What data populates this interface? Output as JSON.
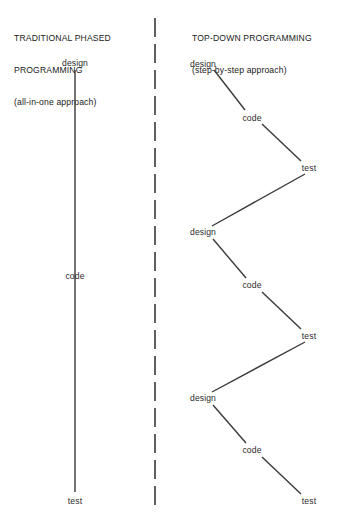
{
  "diagram": {
    "title_left_lines": [
      "TRADITIONAL PHASED",
      "PROGRAMMING"
    ],
    "title_left_sub": "(all-in-one approach)",
    "title_right_lines": [
      "TOP-DOWN PROGRAMMING"
    ],
    "title_right_sub": "(step-by-step approach)",
    "stroke_color": "#3a3a3a",
    "text_color": "#1a1a1a",
    "background_color": "#ffffff",
    "left_column": {
      "nodes": [
        {
          "label": "design",
          "x": 75,
          "y": 63
        },
        {
          "label": "code",
          "x": 75,
          "y": 276
        },
        {
          "label": "test",
          "x": 75,
          "y": 501
        }
      ],
      "line": {
        "x": 75,
        "y1": 70,
        "y2": 492
      }
    },
    "right_column": {
      "nodes": [
        {
          "label": "design",
          "x": 203,
          "y": 64
        },
        {
          "label": "code",
          "x": 252,
          "y": 118
        },
        {
          "label": "test",
          "x": 309,
          "y": 168
        },
        {
          "label": "design",
          "x": 203,
          "y": 232
        },
        {
          "label": "code",
          "x": 252,
          "y": 285
        },
        {
          "label": "test",
          "x": 309,
          "y": 336
        },
        {
          "label": "design",
          "x": 203,
          "y": 398
        },
        {
          "label": "code",
          "x": 252,
          "y": 450
        },
        {
          "label": "test",
          "x": 309,
          "y": 501
        }
      ],
      "segments": [
        {
          "x1": 214,
          "y1": 70,
          "x2": 245,
          "y2": 110
        },
        {
          "x1": 262,
          "y1": 124,
          "x2": 301,
          "y2": 161
        },
        {
          "x1": 305,
          "y1": 174,
          "x2": 212,
          "y2": 226
        },
        {
          "x1": 213,
          "y1": 239,
          "x2": 246,
          "y2": 278
        },
        {
          "x1": 262,
          "y1": 292,
          "x2": 301,
          "y2": 329
        },
        {
          "x1": 305,
          "y1": 342,
          "x2": 212,
          "y2": 392
        },
        {
          "x1": 213,
          "y1": 405,
          "x2": 246,
          "y2": 443
        },
        {
          "x1": 262,
          "y1": 457,
          "x2": 301,
          "y2": 494
        }
      ]
    },
    "divider": {
      "x": 155,
      "y1": 18,
      "y2": 506,
      "dash": 19,
      "gap": 7
    }
  }
}
